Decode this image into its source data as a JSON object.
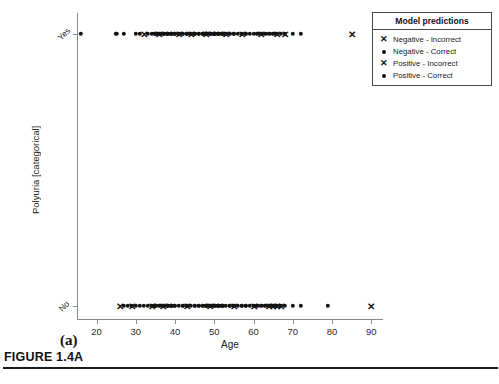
{
  "figure": {
    "caption": "FIGURE 1.4A",
    "subplot_label": "(a)"
  },
  "legend": {
    "title": "Model predictions",
    "entries": [
      {
        "marker": "x",
        "label": "Negative - Incorrect"
      },
      {
        "marker": "dot",
        "label": "Negative - Correct"
      },
      {
        "marker": "x",
        "label": "Positive - Incorrect"
      },
      {
        "marker": "dot",
        "label": "Positive - Correct"
      }
    ]
  },
  "chart_data": {
    "type": "scatter",
    "title": "",
    "xlabel": "Age",
    "ylabel": "Polyuria [categorical]",
    "xlim": [
      15,
      93
    ],
    "xticks": [
      20,
      30,
      40,
      50,
      60,
      70,
      80,
      90
    ],
    "xticklabels": [
      "20",
      "30",
      "40",
      "50",
      "60",
      "70",
      "80",
      "90"
    ],
    "ycategories": [
      "No",
      "Yes"
    ],
    "yticklabels": [
      "No",
      "Yes"
    ],
    "grid": false,
    "legend_position": "upper right",
    "marker_color": "#121212",
    "series": [
      {
        "name": "Positive - Correct",
        "marker": "dot",
        "y": "Yes",
        "x": [
          16,
          25,
          27,
          30,
          31,
          33,
          34,
          35,
          35,
          36,
          37,
          37,
          38,
          38,
          39,
          39,
          40,
          40,
          40,
          41,
          41,
          42,
          42,
          43,
          43,
          43,
          44,
          44,
          45,
          45,
          45,
          46,
          46,
          47,
          47,
          47,
          48,
          48,
          48,
          49,
          49,
          50,
          50,
          50,
          51,
          51,
          52,
          52,
          53,
          53,
          54,
          54,
          55,
          55,
          56,
          57,
          58,
          58,
          59,
          60,
          61,
          62,
          63,
          64,
          65,
          66,
          67,
          68,
          70,
          72
        ]
      },
      {
        "name": "Positive - Incorrect",
        "marker": "x",
        "y": "Yes",
        "x": [
          32,
          36,
          41,
          44,
          48,
          53,
          57,
          62,
          66,
          68,
          85
        ]
      },
      {
        "name": "Negative - Correct",
        "marker": "dot",
        "y": "No",
        "x": [
          27,
          28,
          29,
          30,
          31,
          32,
          33,
          34,
          35,
          35,
          36,
          37,
          38,
          38,
          39,
          39,
          40,
          40,
          41,
          42,
          42,
          43,
          43,
          44,
          45,
          45,
          46,
          46,
          47,
          47,
          48,
          48,
          49,
          50,
          50,
          51,
          51,
          52,
          52,
          53,
          54,
          54,
          55,
          55,
          56,
          57,
          57,
          58,
          58,
          59,
          60,
          61,
          62,
          63,
          64,
          65,
          66,
          67,
          68,
          70,
          72,
          79
        ]
      },
      {
        "name": "Negative - Incorrect",
        "marker": "x",
        "y": "No",
        "x": [
          26,
          29,
          34,
          37,
          43,
          49,
          55,
          60,
          64,
          65,
          66,
          67,
          90
        ]
      }
    ]
  }
}
